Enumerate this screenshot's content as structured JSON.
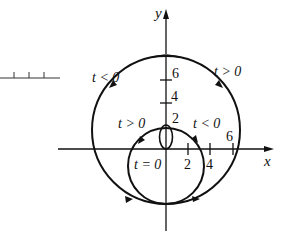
{
  "diagram": {
    "type": "parametric-curve",
    "axes": {
      "x_label": "x",
      "y_label": "y",
      "x_ticks": [
        "2",
        "4",
        "6"
      ],
      "y_ticks": [
        "2",
        "4",
        "6"
      ]
    },
    "labels": {
      "upper_left": "t < 0",
      "upper_right": "t > 0",
      "inner_left": "t > 0",
      "inner_right": "t < 0",
      "origin": "t = 0"
    },
    "stray_scale": {
      "tick_count": 3
    },
    "colors": {
      "stroke": "#111111",
      "background": "#ffffff"
    }
  }
}
